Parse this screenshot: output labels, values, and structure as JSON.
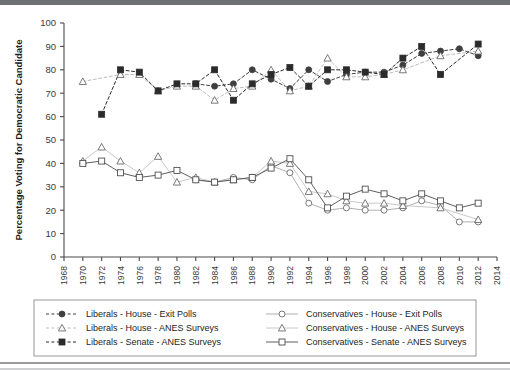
{
  "chart_data": {
    "type": "line",
    "title": "",
    "xlabel": "",
    "ylabel": "Percentage Voting for Democratic Candidate",
    "xlim": [
      1968,
      2014
    ],
    "ylim": [
      0,
      100
    ],
    "ytick_step": 10,
    "xtick_step": 2,
    "grid": false,
    "legend_position": "bottom",
    "yticks": [
      "0",
      "10",
      "20",
      "30",
      "40",
      "50",
      "60",
      "70",
      "80",
      "90",
      "100"
    ],
    "xticks": [
      "1968",
      "1970",
      "1972",
      "1974",
      "1976",
      "1978",
      "1980",
      "1982",
      "1984",
      "1986",
      "1988",
      "1990",
      "1992",
      "1994",
      "1996",
      "1998",
      "2000",
      "2002",
      "2004",
      "2006",
      "2008",
      "2010",
      "2012",
      "2014"
    ],
    "series": [
      {
        "name": "Liberals - House - Exit Polls",
        "key": "lib_house_exit",
        "marker": "filled-circle",
        "line": "dashed",
        "color": "#3f3f3f",
        "points": [
          {
            "x": 1982,
            "y": 74
          },
          {
            "x": 1984,
            "y": 73
          },
          {
            "x": 1986,
            "y": 74
          },
          {
            "x": 1988,
            "y": 80
          },
          {
            "x": 1990,
            "y": 76
          },
          {
            "x": 1992,
            "y": 72
          },
          {
            "x": 1994,
            "y": 80
          },
          {
            "x": 1996,
            "y": 75
          },
          {
            "x": 1998,
            "y": 78
          },
          {
            "x": 2000,
            "y": 79
          },
          {
            "x": 2002,
            "y": 79
          },
          {
            "x": 2004,
            "y": 82
          },
          {
            "x": 2006,
            "y": 87
          },
          {
            "x": 2008,
            "y": 88
          },
          {
            "x": 2010,
            "y": 89
          },
          {
            "x": 2012,
            "y": 86
          }
        ]
      },
      {
        "name": "Liberals - House - ANES Surveys",
        "key": "lib_house_anes",
        "marker": "open-triangle",
        "line": "dashed-light",
        "color": "#6e6e6e",
        "points": [
          {
            "x": 1970,
            "y": 75
          },
          {
            "x": 1974,
            "y": 78
          },
          {
            "x": 1976,
            "y": 78
          },
          {
            "x": 1978,
            "y": 71
          },
          {
            "x": 1980,
            "y": 73
          },
          {
            "x": 1982,
            "y": 73
          },
          {
            "x": 1984,
            "y": 67
          },
          {
            "x": 1986,
            "y": 72
          },
          {
            "x": 1988,
            "y": 73
          },
          {
            "x": 1990,
            "y": 80
          },
          {
            "x": 1992,
            "y": 71
          },
          {
            "x": 1994,
            "y": 73
          },
          {
            "x": 1996,
            "y": 85
          },
          {
            "x": 1998,
            "y": 77
          },
          {
            "x": 2000,
            "y": 77
          },
          {
            "x": 2002,
            "y": 78
          },
          {
            "x": 2004,
            "y": 80
          },
          {
            "x": 2008,
            "y": 86
          },
          {
            "x": 2012,
            "y": 88
          }
        ]
      },
      {
        "name": "Liberals - Senate - ANES Surveys",
        "key": "lib_senate_anes",
        "marker": "filled-square",
        "line": "dashed",
        "color": "#2b2b2b",
        "points": [
          {
            "x": 1972,
            "y": 61
          },
          {
            "x": 1974,
            "y": 80
          },
          {
            "x": 1976,
            "y": 79
          },
          {
            "x": 1978,
            "y": 71
          },
          {
            "x": 1980,
            "y": 74
          },
          {
            "x": 1982,
            "y": 74
          },
          {
            "x": 1984,
            "y": 80
          },
          {
            "x": 1986,
            "y": 67
          },
          {
            "x": 1988,
            "y": 74
          },
          {
            "x": 1990,
            "y": 78
          },
          {
            "x": 1992,
            "y": 81
          },
          {
            "x": 1994,
            "y": 73
          },
          {
            "x": 1996,
            "y": 80
          },
          {
            "x": 1998,
            "y": 80
          },
          {
            "x": 2000,
            "y": 79
          },
          {
            "x": 2002,
            "y": 78
          },
          {
            "x": 2004,
            "y": 85
          },
          {
            "x": 2006,
            "y": 90
          },
          {
            "x": 2008,
            "y": 78
          },
          {
            "x": 2012,
            "y": 91
          }
        ]
      },
      {
        "name": "Conservatives - House - Exit Polls",
        "key": "con_house_exit",
        "marker": "open-circle",
        "line": "solid-light",
        "color": "#8a8a8a",
        "points": [
          {
            "x": 1982,
            "y": 33
          },
          {
            "x": 1984,
            "y": 32
          },
          {
            "x": 1986,
            "y": 34
          },
          {
            "x": 1988,
            "y": 33
          },
          {
            "x": 1990,
            "y": 39
          },
          {
            "x": 1992,
            "y": 36
          },
          {
            "x": 1994,
            "y": 23
          },
          {
            "x": 1996,
            "y": 20
          },
          {
            "x": 1998,
            "y": 21
          },
          {
            "x": 2000,
            "y": 20
          },
          {
            "x": 2002,
            "y": 20
          },
          {
            "x": 2004,
            "y": 21
          },
          {
            "x": 2006,
            "y": 24
          },
          {
            "x": 2008,
            "y": 22
          },
          {
            "x": 2010,
            "y": 15
          },
          {
            "x": 2012,
            "y": 15
          }
        ]
      },
      {
        "name": "Conservatives - House - ANES Surveys",
        "key": "con_house_anes",
        "marker": "open-triangle",
        "line": "solid-lighter",
        "color": "#9a9a9a",
        "points": [
          {
            "x": 1970,
            "y": 41
          },
          {
            "x": 1972,
            "y": 47
          },
          {
            "x": 1974,
            "y": 41
          },
          {
            "x": 1976,
            "y": 36
          },
          {
            "x": 1978,
            "y": 43
          },
          {
            "x": 1980,
            "y": 32
          },
          {
            "x": 1982,
            "y": 34
          },
          {
            "x": 1984,
            "y": 32
          },
          {
            "x": 1986,
            "y": 33
          },
          {
            "x": 1988,
            "y": 34
          },
          {
            "x": 1990,
            "y": 41
          },
          {
            "x": 1992,
            "y": 40
          },
          {
            "x": 1994,
            "y": 28
          },
          {
            "x": 1996,
            "y": 27
          },
          {
            "x": 1998,
            "y": 24
          },
          {
            "x": 2000,
            "y": 23
          },
          {
            "x": 2002,
            "y": 23
          },
          {
            "x": 2004,
            "y": 22
          },
          {
            "x": 2008,
            "y": 21
          },
          {
            "x": 2012,
            "y": 16
          }
        ]
      },
      {
        "name": "Conservatives - Senate - ANES Surveys",
        "key": "con_senate_anes",
        "marker": "open-square",
        "line": "solid",
        "color": "#555555",
        "points": [
          {
            "x": 1970,
            "y": 40
          },
          {
            "x": 1972,
            "y": 41
          },
          {
            "x": 1974,
            "y": 36
          },
          {
            "x": 1976,
            "y": 34
          },
          {
            "x": 1978,
            "y": 35
          },
          {
            "x": 1980,
            "y": 37
          },
          {
            "x": 1982,
            "y": 33
          },
          {
            "x": 1984,
            "y": 32
          },
          {
            "x": 1986,
            "y": 33
          },
          {
            "x": 1988,
            "y": 34
          },
          {
            "x": 1990,
            "y": 38
          },
          {
            "x": 1992,
            "y": 42
          },
          {
            "x": 1994,
            "y": 33
          },
          {
            "x": 1996,
            "y": 21
          },
          {
            "x": 1998,
            "y": 26
          },
          {
            "x": 2000,
            "y": 29
          },
          {
            "x": 2002,
            "y": 27
          },
          {
            "x": 2004,
            "y": 24
          },
          {
            "x": 2006,
            "y": 27
          },
          {
            "x": 2008,
            "y": 24
          },
          {
            "x": 2010,
            "y": 21
          },
          {
            "x": 2012,
            "y": 23
          }
        ]
      }
    ]
  },
  "legend": {
    "items": [
      {
        "label": "Liberals - House - Exit Polls",
        "marker": "filled-circle",
        "line": "dashed",
        "color": "#3f3f3f"
      },
      {
        "label": "Liberals - House - ANES Surveys",
        "marker": "open-triangle",
        "line": "dashed-light",
        "color": "#6e6e6e"
      },
      {
        "label": "Liberals - Senate - ANES Surveys",
        "marker": "filled-square",
        "line": "dashed",
        "color": "#2b2b2b"
      },
      {
        "label": "Conservatives - House - Exit Polls",
        "marker": "open-circle",
        "line": "solid-light",
        "color": "#8a8a8a"
      },
      {
        "label": "Conservatives - House - ANES Surveys",
        "marker": "open-triangle",
        "line": "solid-lighter",
        "color": "#9a9a9a"
      },
      {
        "label": "Conservatives - Senate - ANES Surveys",
        "marker": "open-square",
        "line": "solid",
        "color": "#555555"
      }
    ]
  },
  "colors": {
    "axis": "#4a4a4a",
    "text": "#1d1d1d",
    "background": "#ffffff",
    "top_band": "#6f7072",
    "bottom_band": "#9a9b9d"
  }
}
